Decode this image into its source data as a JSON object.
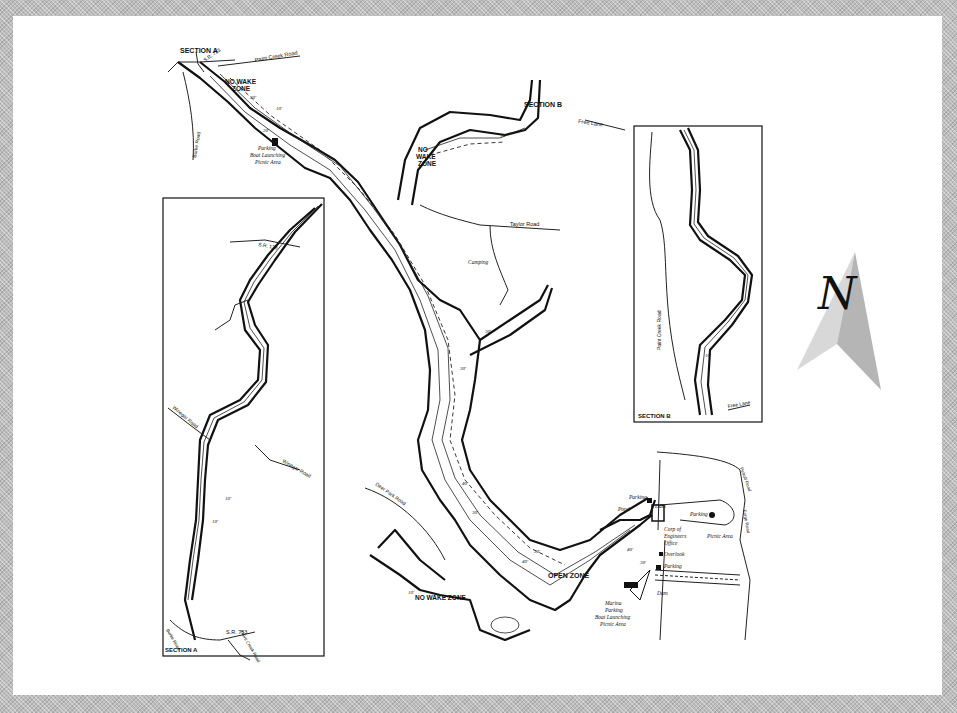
{
  "map": {
    "title": "Paint Creek Lake depth map",
    "sections": {
      "section_a_label": "SECTION A",
      "section_b_label": "SECTION B"
    },
    "zones": {
      "no_wake_1": "NO WAKE",
      "no_wake_1b": "ZONE",
      "no_wake_2": "NO",
      "no_wake_2b": "WAKE",
      "no_wake_2c": "ZONE",
      "no_wake_3": "NO WAKE ZONE",
      "open_zone": "OPEN ZONE"
    },
    "roads": {
      "sr753_top": "S.R. 753",
      "paint_creek_road_top": "Paint Creek Road",
      "burke_road_top": "Burke Road",
      "free_lane_top": "Free Lane",
      "taylor_road": "Taylor Road",
      "deer_park_road": "Deer Park Road",
      "sr138": "S.R. 138",
      "winegar_road_1": "Winegar Road",
      "winegar_road_2": "Winegar Road",
      "sr753_bottom": "S.R. 753",
      "burke_road_bottom": "Burke Road",
      "paint_creek_road_bottom": "Paint Creek Road",
      "paint_creek_road_b": "Paint Creek Road",
      "free_lane_b": "Free Lane",
      "petroff_road": "Petroff Road",
      "forge_road": "Forge Road"
    },
    "facilities": {
      "parking_launch_1": "Parking",
      "parking_launch_2": "Boat Launching",
      "parking_launch_3": "Picnic Area",
      "camping": "Camping",
      "parking_dam": "Parking",
      "pond": "Pond",
      "dam_top": "Dam",
      "parking_picnic": "Parking",
      "picnic_area": "Picnic Area",
      "corps_1": "Corp of",
      "corps_2": "Engineers",
      "corps_3": "Office",
      "overlook": "Overlook",
      "parking_lower": "Parking",
      "dam_lower": "Dam",
      "marina_1": "Marina",
      "marina_2": "Parking",
      "marina_3": "Boat Launching",
      "marina_4": "Picnic Area"
    },
    "depths": [
      "10'",
      "20'",
      "30'",
      "40'"
    ],
    "compass": {
      "letter": "N",
      "meaning": "north"
    }
  }
}
